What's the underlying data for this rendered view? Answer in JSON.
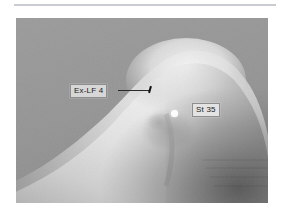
{
  "figure": {
    "type": "clinical-photograph",
    "background_color": "#969696",
    "rule_color": "#c9cdd2",
    "page_background": "#ffffff"
  },
  "annotations": [
    {
      "id": "ex-lf-4",
      "label": "Ex-LF 4",
      "marker": "needle",
      "box_color": "#d7d7d7",
      "text_color": "#1a1a1a",
      "leader": true
    },
    {
      "id": "st-35",
      "label": "St 35",
      "marker": "white-dot",
      "box_color": "#e3e3e3",
      "text_color": "#1a1a1a",
      "leader": false
    }
  ],
  "labels": {
    "ex_lf_4": "Ex-LF 4",
    "st_35": "St 35"
  }
}
